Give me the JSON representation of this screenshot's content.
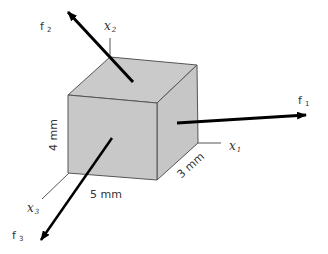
{
  "diagram": {
    "type": "cube-with-force-vectors",
    "cube": {
      "face_color": "#c9c9c9",
      "edge_color": "#555555",
      "dimensions": {
        "height_label": "4 mm",
        "width_label": "5 mm",
        "depth_label": "3 mm"
      }
    },
    "axes": [
      {
        "id": "x1",
        "label": "x",
        "subscript": "1"
      },
      {
        "id": "x2",
        "label": "x",
        "subscript": "2"
      },
      {
        "id": "x3",
        "label": "x",
        "subscript": "3"
      }
    ],
    "forces": [
      {
        "id": "f1",
        "label": "f",
        "subscript": "1",
        "direction": "along x1 (right)"
      },
      {
        "id": "f2",
        "label": "f",
        "subscript": "2",
        "direction": "up-left from top face"
      },
      {
        "id": "f3",
        "label": "f",
        "subscript": "3",
        "direction": "along x3 (down-left)"
      }
    ],
    "arrow_color": "#000000"
  }
}
